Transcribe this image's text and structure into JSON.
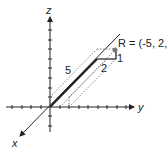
{
  "diagram": {
    "axes": {
      "x_label": "x",
      "y_label": "y",
      "z_label": "z"
    },
    "point": {
      "label": "R = (-5, 2, 1)"
    },
    "dimensions": {
      "length_5": "5",
      "length_2": "2",
      "length_1": "1"
    },
    "colors": {
      "line": "#222222",
      "dotted": "#666666",
      "point": "#777777"
    }
  }
}
